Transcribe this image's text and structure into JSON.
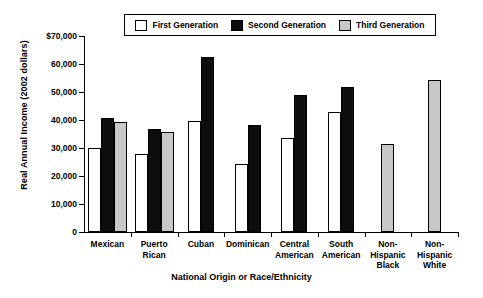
{
  "chart_data": {
    "type": "bar",
    "title": "",
    "xlabel": "National Origin or Race/Ethnicity",
    "ylabel": "Real Annual Income (2002 dollars)",
    "ylim": [
      0,
      70000
    ],
    "yticks": [
      0,
      10000,
      20000,
      30000,
      40000,
      50000,
      60000,
      70000
    ],
    "ytick_labels": [
      "0",
      "10,000",
      "20,000",
      "30,000",
      "40,000",
      "50,000",
      "60,000",
      "$70,000"
    ],
    "grid": false,
    "legend_position": "top-center",
    "categories": [
      "Mexican",
      "Puerto\nRican",
      "Cuban",
      "Dominican",
      "Central\nAmerican",
      "South\nAmerican",
      "Non-\nHispanic\nBlack",
      "Non-\nHispanic\nWhite"
    ],
    "series": [
      {
        "name": "First Generation",
        "color": "#ffffff",
        "values": [
          30000,
          27900,
          39600,
          24300,
          33500,
          42900,
          null,
          null
        ]
      },
      {
        "name": "Second Generation",
        "color": "#0d0d0d",
        "values": [
          40700,
          36800,
          62500,
          38100,
          49000,
          51700,
          null,
          null
        ]
      },
      {
        "name": "Third Generation",
        "color": "#c8c8c8",
        "values": [
          39400,
          35800,
          null,
          null,
          null,
          null,
          31600,
          54400
        ]
      }
    ]
  },
  "legend": {
    "items": [
      {
        "label": "First Generation",
        "key": "first"
      },
      {
        "label": "Second Generation",
        "key": "second"
      },
      {
        "label": "Third Generation",
        "key": "third"
      }
    ]
  }
}
